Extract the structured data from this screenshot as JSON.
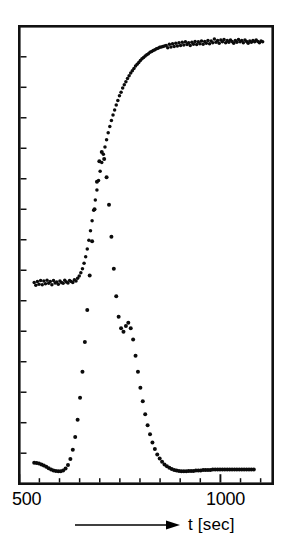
{
  "figure": {
    "background_color": "#ffffff",
    "ink_color": "#0b0b0b"
  },
  "axis": {
    "x_title": "t [sec]",
    "x_tick_labels": [
      "500",
      "1000"
    ],
    "x_label_left": "500",
    "x_label_right": "1000",
    "arrow_name": "right-arrow-icon"
  },
  "chart_data": {
    "type": "scatter",
    "title": "",
    "subtitle": "",
    "xlabel": "t [sec]",
    "ylabel": "",
    "xlim": [
      500,
      1130
    ],
    "ylim": [
      0,
      100
    ],
    "x_ticks": [
      500,
      550,
      600,
      650,
      700,
      750,
      800,
      850,
      900,
      950,
      1000,
      1050,
      1100
    ],
    "x_tick_labels_shown": {
      "500": "500",
      "1000": "1000"
    },
    "y_ticks_count": 14,
    "y_tick_labels_shown": [],
    "grid": false,
    "legend": null,
    "legend_position": "none",
    "annotations": [],
    "series": [
      {
        "name": "sigmoid-signal",
        "marker": "filled-circle",
        "style": "dense dotted trace",
        "points": [
          [
            537,
            44.0
          ],
          [
            541,
            43.4
          ],
          [
            545,
            44.2
          ],
          [
            549,
            43.6
          ],
          [
            553,
            44.4
          ],
          [
            557,
            43.5
          ],
          [
            561,
            44.3
          ],
          [
            565,
            43.7
          ],
          [
            569,
            44.5
          ],
          [
            573,
            43.8
          ],
          [
            577,
            44.2
          ],
          [
            581,
            43.5
          ],
          [
            585,
            44.4
          ],
          [
            589,
            43.9
          ],
          [
            593,
            44.1
          ],
          [
            597,
            43.6
          ],
          [
            601,
            44.3
          ],
          [
            605,
            44.0
          ],
          [
            609,
            43.8
          ],
          [
            613,
            44.5
          ],
          [
            617,
            44.1
          ],
          [
            621,
            43.9
          ],
          [
            625,
            44.4
          ],
          [
            629,
            44.2
          ],
          [
            633,
            44.0
          ],
          [
            637,
            44.6
          ],
          [
            641,
            44.3
          ],
          [
            645,
            44.9
          ],
          [
            649,
            45.4
          ],
          [
            653,
            46.1
          ],
          [
            657,
            47.0
          ],
          [
            661,
            48.2
          ],
          [
            665,
            49.6
          ],
          [
            669,
            51.3
          ],
          [
            673,
            53.2
          ],
          [
            677,
            55.3
          ],
          [
            681,
            57.5
          ],
          [
            685,
            59.8
          ],
          [
            689,
            62.0
          ],
          [
            693,
            64.2
          ],
          [
            697,
            66.3
          ],
          [
            701,
            68.3
          ],
          [
            705,
            70.2
          ],
          [
            709,
            72.0
          ],
          [
            713,
            73.6
          ],
          [
            717,
            75.2
          ],
          [
            721,
            76.7
          ],
          [
            725,
            78.1
          ],
          [
            729,
            79.4
          ],
          [
            733,
            80.6
          ],
          [
            737,
            81.7
          ],
          [
            741,
            82.8
          ],
          [
            745,
            83.8
          ],
          [
            749,
            84.8
          ],
          [
            753,
            85.6
          ],
          [
            757,
            86.5
          ],
          [
            761,
            87.2
          ],
          [
            765,
            87.9
          ],
          [
            769,
            88.6
          ],
          [
            773,
            89.2
          ],
          [
            777,
            89.8
          ],
          [
            781,
            90.3
          ],
          [
            785,
            90.8
          ],
          [
            789,
            91.3
          ],
          [
            793,
            91.7
          ],
          [
            797,
            92.1
          ],
          [
            801,
            92.5
          ],
          [
            805,
            92.9
          ],
          [
            809,
            93.2
          ],
          [
            813,
            93.5
          ],
          [
            817,
            93.8
          ],
          [
            821,
            94.0
          ],
          [
            825,
            94.3
          ],
          [
            829,
            94.5
          ],
          [
            833,
            94.7
          ],
          [
            837,
            94.9
          ],
          [
            841,
            95.1
          ],
          [
            845,
            95.2
          ],
          [
            849,
            95.4
          ],
          [
            853,
            95.5
          ],
          [
            857,
            95.6
          ],
          [
            861,
            95.7
          ],
          [
            865,
            95.8
          ],
          [
            869,
            95.3
          ],
          [
            873,
            96.1
          ],
          [
            877,
            95.5
          ],
          [
            881,
            96.2
          ],
          [
            885,
            95.6
          ],
          [
            889,
            96.3
          ],
          [
            893,
            95.7
          ],
          [
            897,
            96.4
          ],
          [
            901,
            95.8
          ],
          [
            905,
            96.5
          ],
          [
            909,
            95.9
          ],
          [
            913,
            96.6
          ],
          [
            917,
            96.0
          ],
          [
            921,
            96.4
          ],
          [
            925,
            95.8
          ],
          [
            929,
            96.5
          ],
          [
            933,
            96.1
          ],
          [
            937,
            96.7
          ],
          [
            941,
            96.0
          ],
          [
            945,
            96.6
          ],
          [
            949,
            96.2
          ],
          [
            953,
            96.8
          ],
          [
            957,
            96.1
          ],
          [
            961,
            96.7
          ],
          [
            965,
            96.3
          ],
          [
            969,
            96.9
          ],
          [
            973,
            96.2
          ],
          [
            977,
            96.8
          ],
          [
            981,
            96.4
          ],
          [
            985,
            97.2
          ],
          [
            989,
            96.5
          ],
          [
            993,
            96.9
          ],
          [
            997,
            96.3
          ],
          [
            1001,
            97.0
          ],
          [
            1005,
            96.6
          ],
          [
            1009,
            97.1
          ],
          [
            1013,
            96.4
          ],
          [
            1017,
            96.9
          ],
          [
            1021,
            96.5
          ],
          [
            1025,
            97.0
          ],
          [
            1029,
            96.7
          ],
          [
            1033,
            96.3
          ],
          [
            1037,
            96.9
          ],
          [
            1041,
            96.5
          ],
          [
            1045,
            97.1
          ],
          [
            1049,
            96.6
          ],
          [
            1053,
            96.9
          ],
          [
            1057,
            96.4
          ],
          [
            1061,
            97.0
          ],
          [
            1065,
            96.7
          ],
          [
            1069,
            96.3
          ],
          [
            1073,
            96.8
          ],
          [
            1077,
            96.5
          ],
          [
            1081,
            96.9
          ],
          [
            1085,
            96.6
          ],
          [
            1089,
            97.0
          ],
          [
            1093,
            96.7
          ],
          [
            1097,
            96.4
          ],
          [
            1101,
            96.8
          ],
          [
            1105,
            96.6
          ]
        ]
      },
      {
        "name": "derivative-peak-signal",
        "marker": "filled-circle",
        "style": "sparse dotted trace with bimodal peak",
        "points": [
          [
            537,
            4.6
          ],
          [
            543,
            4.5
          ],
          [
            549,
            4.4
          ],
          [
            555,
            4.2
          ],
          [
            561,
            4.0
          ],
          [
            567,
            3.7
          ],
          [
            573,
            3.4
          ],
          [
            579,
            3.1
          ],
          [
            585,
            2.9
          ],
          [
            591,
            2.8
          ],
          [
            597,
            2.7
          ],
          [
            603,
            2.7
          ],
          [
            609,
            2.9
          ],
          [
            615,
            3.3
          ],
          [
            621,
            4.1
          ],
          [
            627,
            5.4
          ],
          [
            633,
            7.4
          ],
          [
            639,
            10.2
          ],
          [
            645,
            14.0
          ],
          [
            651,
            18.8
          ],
          [
            657,
            24.5
          ],
          [
            663,
            31.0
          ],
          [
            669,
            38.0
          ],
          [
            675,
            45.5
          ],
          [
            681,
            53.0
          ],
          [
            687,
            60.0
          ],
          [
            693,
            66.0
          ],
          [
            699,
            70.5
          ],
          [
            705,
            72.5
          ],
          [
            711,
            71.0
          ],
          [
            717,
            67.0
          ],
          [
            723,
            61.0
          ],
          [
            729,
            54.0
          ],
          [
            735,
            47.0
          ],
          [
            741,
            41.0
          ],
          [
            747,
            36.5
          ],
          [
            753,
            34.0
          ],
          [
            759,
            33.2
          ],
          [
            765,
            34.5
          ],
          [
            771,
            35.2
          ],
          [
            777,
            34.0
          ],
          [
            783,
            31.5
          ],
          [
            789,
            28.0
          ],
          [
            795,
            24.5
          ],
          [
            801,
            21.0
          ],
          [
            807,
            18.0
          ],
          [
            813,
            15.2
          ],
          [
            819,
            12.8
          ],
          [
            825,
            10.8
          ],
          [
            831,
            9.0
          ],
          [
            837,
            7.6
          ],
          [
            843,
            6.4
          ],
          [
            849,
            5.5
          ],
          [
            855,
            4.8
          ],
          [
            861,
            4.2
          ],
          [
            867,
            3.8
          ],
          [
            873,
            3.5
          ],
          [
            879,
            3.2
          ],
          [
            885,
            3.0
          ],
          [
            891,
            2.9
          ],
          [
            897,
            2.8
          ],
          [
            903,
            2.7
          ],
          [
            909,
            2.7
          ],
          [
            915,
            2.7
          ],
          [
            921,
            2.8
          ],
          [
            927,
            2.8
          ],
          [
            933,
            2.8
          ],
          [
            939,
            2.9
          ],
          [
            945,
            2.9
          ],
          [
            951,
            2.9
          ],
          [
            957,
            3.0
          ],
          [
            963,
            3.0
          ],
          [
            969,
            3.0
          ],
          [
            975,
            3.0
          ],
          [
            981,
            3.1
          ],
          [
            987,
            3.1
          ],
          [
            993,
            3.1
          ],
          [
            999,
            3.1
          ],
          [
            1005,
            3.1
          ],
          [
            1011,
            3.1
          ],
          [
            1017,
            3.1
          ],
          [
            1023,
            3.1
          ],
          [
            1029,
            3.1
          ],
          [
            1035,
            3.1
          ],
          [
            1041,
            3.1
          ],
          [
            1047,
            3.1
          ],
          [
            1053,
            3.1
          ],
          [
            1059,
            3.1
          ],
          [
            1065,
            3.1
          ],
          [
            1071,
            3.1
          ],
          [
            1077,
            3.1
          ],
          [
            1083,
            3.1
          ]
        ]
      }
    ]
  }
}
